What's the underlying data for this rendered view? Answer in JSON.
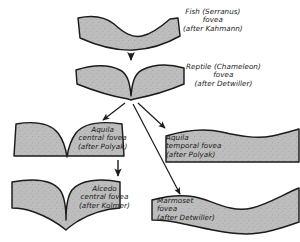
{
  "figure": {
    "background_color": "#ffffff",
    "ink_color": "#1b1b1b",
    "fill_color": "#b8b8b8"
  },
  "panels": [
    {
      "id": "fish",
      "name": "fish-fovea-panel",
      "caption_lines": [
        "Fish (Serranus)",
        "fovea",
        "(after Kahmann)"
      ],
      "shape": "shallow-broad-concave-band"
    },
    {
      "id": "reptile",
      "name": "reptile-fovea-panel",
      "caption_lines": [
        "Reptile (Chameleon)",
        "fovea",
        "(after Detwiller)"
      ],
      "shape": "deep-narrow-v-notch-band"
    },
    {
      "id": "aquila-central",
      "name": "aquila-central-fovea-panel",
      "caption_lines": [
        "Aquila",
        "central fovea",
        "(after Polyak)"
      ],
      "shape": "deep-v-notch-rounded-shoulders"
    },
    {
      "id": "aquila-temporal",
      "name": "aquila-temporal-fovea-panel",
      "caption_lines": [
        "Aquila",
        "temporal fovea",
        "(after Polyak)"
      ],
      "shape": "shallow-wavy-band"
    },
    {
      "id": "alcedo",
      "name": "alcedo-central-fovea-panel",
      "caption_lines": [
        "Alcedo",
        "central fovea",
        "(after Kolmer)"
      ],
      "shape": "very-deep-narrow-slit-wavy-base"
    },
    {
      "id": "marmoset",
      "name": "marmoset-fovea-panel",
      "caption_lines": [
        "Marmoset",
        "fovea",
        "(after Detwiller)"
      ],
      "shape": "broad-shallow-s-curve-band"
    }
  ],
  "arrows": [
    {
      "name": "arrow-fish-to-reptile",
      "from": "fish",
      "to": "reptile",
      "direction": "down"
    },
    {
      "name": "arrow-reptile-to-aquila-central",
      "from": "reptile",
      "to": "aquila-central",
      "direction": "down-left"
    },
    {
      "name": "arrow-reptile-to-aquila-temporal",
      "from": "reptile",
      "to": "aquila-temporal",
      "direction": "down-right"
    },
    {
      "name": "arrow-aquila-central-to-alcedo",
      "from": "aquila-central",
      "to": "alcedo",
      "direction": "down"
    },
    {
      "name": "arrow-reptile-to-marmoset",
      "from": "reptile",
      "to": "marmoset",
      "direction": "down-right-long"
    }
  ]
}
